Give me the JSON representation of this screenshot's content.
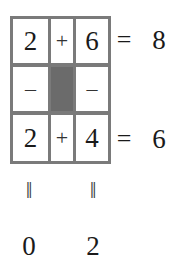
{
  "puzzle": {
    "rows": [
      {
        "cells": [
          {
            "type": "number",
            "value": "2"
          },
          {
            "type": "operator",
            "value": "+"
          },
          {
            "type": "number",
            "value": "6"
          }
        ],
        "equals": "=",
        "result": "8"
      },
      {
        "cells": [
          {
            "type": "operator",
            "value": "–"
          },
          {
            "type": "blocked",
            "value": ""
          },
          {
            "type": "operator",
            "value": "–"
          }
        ]
      },
      {
        "cells": [
          {
            "type": "number",
            "value": "2"
          },
          {
            "type": "operator",
            "value": "+"
          },
          {
            "type": "number",
            "value": "4"
          }
        ],
        "equals": "=",
        "result": "6"
      }
    ],
    "column_equals": [
      "‖",
      "‖"
    ],
    "column_results": [
      "0",
      "2"
    ]
  },
  "colors": {
    "grid_line": "#7a7a7a",
    "blocked_cell": "#6b6b6b",
    "cell_bg": "#ffffff",
    "text": "#1a1a1a"
  }
}
